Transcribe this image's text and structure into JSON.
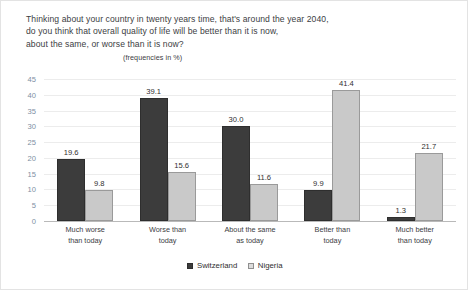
{
  "chart_data": {
    "type": "bar",
    "title_lines": [
      "Thinking about your country in twenty years time, that's around the year 2040,",
      "do you think that overall quality of life will be better than it is now,",
      "about the same, or worse than it is now?"
    ],
    "subtitle": "(frequencies in %)",
    "categories": [
      "Much worse\nthan today",
      "Worse than\ntoday",
      "About the same\nas today",
      "Better than\ntoday",
      "Much better\nthan today"
    ],
    "category_lines": [
      [
        "Much worse",
        "than today"
      ],
      [
        "Worse than",
        "today"
      ],
      [
        "About the same",
        "as today"
      ],
      [
        "Better than",
        "today"
      ],
      [
        "Much better",
        "than today"
      ]
    ],
    "series": [
      {
        "name": "Switzerland",
        "color": "#3c3c3c",
        "values": [
          19.6,
          39.1,
          30.0,
          9.9,
          1.3
        ],
        "labels": [
          "19.6",
          "39.1",
          "30.0",
          "9.9",
          "1.3"
        ]
      },
      {
        "name": "Nigeria",
        "color": "#c9c9c9",
        "values": [
          9.8,
          15.6,
          11.6,
          41.4,
          21.7
        ],
        "labels": [
          "9.8",
          "15.6",
          "11.6",
          "41.4",
          "21.7"
        ]
      }
    ],
    "xlabel": "",
    "ylabel": "",
    "ylim": [
      0,
      45
    ],
    "yticks": [
      0,
      5,
      10,
      15,
      20,
      25,
      30,
      35,
      40,
      45
    ],
    "ytick_labels": [
      "0",
      "5",
      "10",
      "15",
      "20",
      "25",
      "30",
      "35",
      "40",
      "45"
    ],
    "grid": true,
    "legend_position": "bottom",
    "axis_label_color": "#7d8fa3"
  }
}
